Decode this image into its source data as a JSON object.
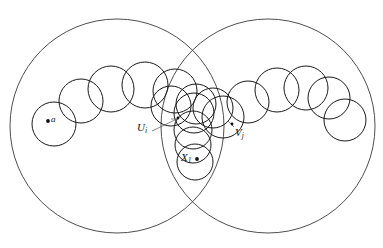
{
  "figure": {
    "type": "geometric-diagram",
    "background_color": "#ffffff",
    "stroke_color": "#1a1a1a",
    "big_circle_stroke": "#3a3a3a",
    "leader_stroke": "#555555"
  },
  "labels": {
    "a": {
      "base": "a",
      "sub": ""
    },
    "Ui": {
      "base": "U",
      "sub": "i"
    },
    "Vj": {
      "base": "V",
      "sub": "j"
    },
    "X1": {
      "base": "X",
      "sub": "1"
    }
  },
  "big_circles": [
    {
      "name": "left-region",
      "cx": 117,
      "cy": 126,
      "r": 107
    },
    {
      "name": "right-region",
      "cx": 268,
      "cy": 126,
      "r": 107
    }
  ],
  "chains": {
    "left": [
      {
        "cx": 54,
        "cy": 124,
        "r": 22
      },
      {
        "cx": 81,
        "cy": 101,
        "r": 22
      },
      {
        "cx": 111,
        "cy": 89,
        "r": 23
      },
      {
        "cx": 145,
        "cy": 85,
        "r": 23
      },
      {
        "cx": 175,
        "cy": 91,
        "r": 22
      },
      {
        "cx": 196,
        "cy": 104,
        "r": 20
      }
    ],
    "right": [
      {
        "cx": 223,
        "cy": 117,
        "r": 21
      },
      {
        "cx": 248,
        "cy": 102,
        "r": 21
      },
      {
        "cx": 277,
        "cy": 90,
        "r": 22
      },
      {
        "cx": 306,
        "cy": 88,
        "r": 22
      },
      {
        "cx": 329,
        "cy": 98,
        "r": 21
      },
      {
        "cx": 345,
        "cy": 120,
        "r": 21
      }
    ],
    "center_stack": [
      {
        "cx": 194,
        "cy": 113,
        "r": 20
      },
      {
        "cx": 193,
        "cy": 130,
        "r": 19
      },
      {
        "cx": 193,
        "cy": 145,
        "r": 18
      },
      {
        "cx": 195,
        "cy": 162,
        "r": 18
      }
    ],
    "mid_extra": [
      {
        "cx": 171,
        "cy": 106,
        "r": 20
      },
      {
        "cx": 213,
        "cy": 108,
        "r": 20
      }
    ]
  },
  "points": [
    {
      "name": "point-a",
      "x": 48,
      "y": 121
    },
    {
      "name": "point-Ui",
      "x": 178,
      "y": 118
    },
    {
      "name": "point-Vj",
      "x": 232,
      "y": 124
    },
    {
      "name": "point-X1",
      "x": 197,
      "y": 159
    }
  ],
  "leaders": [
    {
      "name": "leader-Ui",
      "x1": 152,
      "y1": 131,
      "x2": 177,
      "y2": 119
    },
    {
      "name": "leader-Vj",
      "x1": 228,
      "y1": 121,
      "x2": 234,
      "y2": 127
    }
  ]
}
